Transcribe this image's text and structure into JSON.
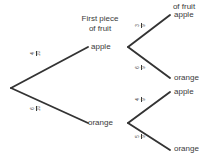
{
  "diagram": {
    "type": "probability-tree",
    "title_first": "First piece\nof fruit",
    "headers": {
      "first_line1": "First piece",
      "first_line2": "of fruit",
      "second_line1": "of fruit"
    },
    "colors": {
      "background": "#ffffff",
      "line": "#333333",
      "text": "#3a3a3a"
    },
    "root": {
      "label": ""
    },
    "level1": [
      {
        "label": "apple",
        "probability_num": "4",
        "probability_den": "10"
      },
      {
        "label": "orange",
        "probability_num": "6",
        "probability_den": "10"
      }
    ],
    "level2": [
      {
        "parent": "apple",
        "label": "apple",
        "probability_num": "3",
        "probability_den": "9"
      },
      {
        "parent": "apple",
        "label": "orange",
        "probability_num": "6",
        "probability_den": "9"
      },
      {
        "parent": "orange",
        "label": "apple",
        "probability_num": "4",
        "probability_den": "9"
      },
      {
        "parent": "orange",
        "label": "orange",
        "probability_num": "5",
        "probability_den": "9"
      }
    ]
  }
}
